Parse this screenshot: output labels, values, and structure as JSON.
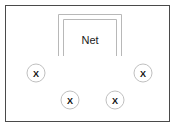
{
  "diagram": {
    "background_color": "#ffffff",
    "boundary": {
      "label": "court-boundary",
      "stroke_color": "#4a4a4a",
      "x": 5.5,
      "y": 5.5,
      "width": 164,
      "height": 116
    },
    "net": {
      "label": "Net",
      "stroke_color": "#b8b8b8",
      "text_color": "#1a1a1a",
      "outer": {
        "left": 58,
        "right": 122,
        "top": 14,
        "bottom": 56
      },
      "inner": {
        "left": 63,
        "right": 117,
        "top": 19,
        "bottom": 56
      },
      "label_x": 90,
      "label_y": 41
    },
    "markers": {
      "glyph": "X",
      "radius": 9,
      "circle_stroke": "#c0c0c0",
      "glyph_color": "#111111",
      "items": [
        {
          "name": "player-marker-left",
          "glyph": "X",
          "cx": 36,
          "cy": 73
        },
        {
          "name": "player-marker-right",
          "glyph": "X",
          "cx": 143,
          "cy": 73
        },
        {
          "name": "player-marker-bottom-left",
          "glyph": "X",
          "cx": 70,
          "cy": 100
        },
        {
          "name": "player-marker-bottom-right",
          "glyph": "X",
          "cx": 115,
          "cy": 100
        }
      ]
    }
  }
}
